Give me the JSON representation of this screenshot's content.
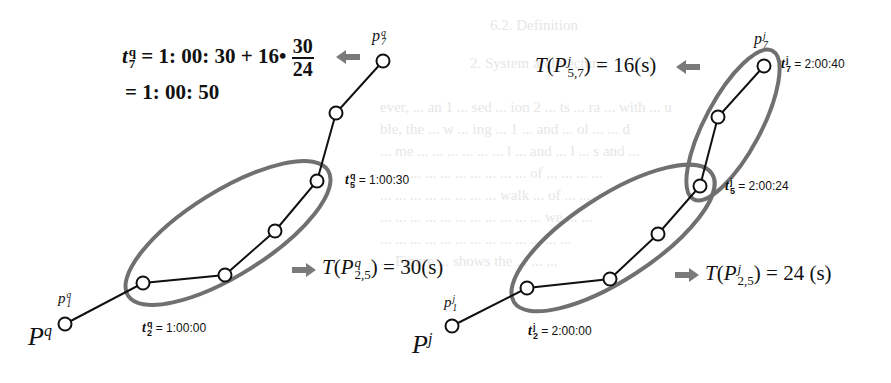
{
  "figure": {
    "left_trajectory": {
      "name_base": "P",
      "name_sup": "q",
      "start_point": {
        "base": "p",
        "sub": "1",
        "sup": "q"
      },
      "end_point": {
        "base": "p",
        "sub": "7",
        "sup": "q"
      },
      "t2_label": {
        "base": "t",
        "sub": "2",
        "sup": "q",
        "value": "= 1:00:00"
      },
      "t5_label": {
        "base": "t",
        "sub": "5",
        "sup": "q",
        "value": "= 1:00:30"
      },
      "formula": {
        "lhs_base": "t",
        "lhs_sub": "7",
        "lhs_sup": "q",
        "expr": "= 1: 00: 30 + 16•",
        "frac_num": "30",
        "frac_den": "24",
        "result": "= 1: 00: 50"
      },
      "duration": {
        "prefix": "T(P",
        "sub": "2,5",
        "sup": "q",
        "suffix": ") = 30(s)"
      },
      "nodes": [
        [
          65,
          324
        ],
        [
          143,
          283
        ],
        [
          225,
          275
        ],
        [
          275,
          231
        ],
        [
          317,
          181
        ],
        [
          336,
          113
        ],
        [
          383,
          61
        ]
      ]
    },
    "right_trajectory": {
      "name_base": "P",
      "name_sup": "j",
      "start_point": {
        "base": "p",
        "sub": "1",
        "sup": "j"
      },
      "end_point": {
        "base": "p",
        "sub": "7",
        "sup": "j"
      },
      "t2_label": {
        "base": "t",
        "sub": "2",
        "sup": "j",
        "value": "= 2:00:00"
      },
      "t5_label": {
        "base": "t",
        "sub": "5",
        "sup": "j",
        "value": "= 2:00:24"
      },
      "t7_label": {
        "base": "t",
        "sub": "7",
        "sup": "j",
        "value": "= 2:00:40"
      },
      "duration_57": {
        "prefix": "T(P",
        "sub": "5,7",
        "sup": "j",
        "suffix": ") = 16(s)"
      },
      "duration_25": {
        "prefix": "T(P",
        "sub": "2,5",
        "sup": "j",
        "suffix": ") = 24 (s)"
      },
      "nodes": [
        [
          452,
          326
        ],
        [
          527,
          288
        ],
        [
          610,
          279
        ],
        [
          658,
          234
        ],
        [
          700,
          186
        ],
        [
          718,
          117
        ],
        [
          764,
          66
        ]
      ]
    },
    "colors": {
      "line": "#111111",
      "ellipse": "#707070",
      "arrow": "#7a7a7a",
      "ghost_text": "#e6e6e6"
    }
  },
  "background_text": [
    "6.2. Definition",
    "2. System architecture",
    "ever, ... an 1 ... sed ... ion 2 ... ts ... ra ... with ... u",
    "ble, the ... w ... ing ... 1 ... and ... ol ... ... d",
    "... me ... ... ... ... ... ... l ... and ... l ... s and ...",
    "... ... ... ... ... ... ... ... ... ... of ... ... ... ...",
    "... ... ... ... ... ... ... ... walk ... of ... ...",
    "... ... ... ... ... ... ... ... ... ... ... we ... ...",
    "... ... ... ... ... ... ... ... ... ... ... ... ...",
    "... Figure ... shows the ... ... ..."
  ]
}
